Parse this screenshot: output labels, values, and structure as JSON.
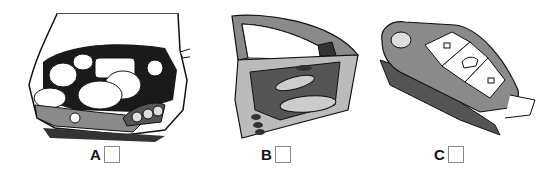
{
  "options": [
    {
      "letter": "A",
      "image": "car-engine-open-hood"
    },
    {
      "letter": "B",
      "image": "car-door-open"
    },
    {
      "letter": "C",
      "image": "car-key-fob"
    }
  ],
  "colors": {
    "gray": "#8a8a8a",
    "dark": "#555555",
    "light": "#d0d0d0",
    "line": "#111111"
  }
}
